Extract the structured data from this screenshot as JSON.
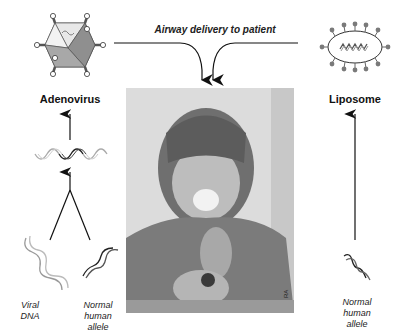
{
  "header": {
    "delivery_label": "Airway delivery to patient"
  },
  "left_column": {
    "vector_label": "Adenovirus",
    "vector_icon": "adenovirus-icon",
    "recombinant_icon": "recombinant-dna-icon",
    "inputs": [
      {
        "label_lines": [
          "Viral",
          "DNA"
        ],
        "icon": "viral-dna-icon"
      },
      {
        "label_lines": [
          "Normal",
          "human",
          "allele"
        ],
        "icon": "human-allele-icon"
      }
    ]
  },
  "right_column": {
    "vector_label": "Liposome",
    "vector_icon": "liposome-icon",
    "input": {
      "label_lines": [
        "Normal",
        "human",
        "allele"
      ],
      "icon": "human-allele-icon"
    }
  },
  "photo": {
    "subject": "child using inhaler with face mask",
    "credit": "RA"
  },
  "colors": {
    "stroke": "#111111",
    "viral_dna": "#8a8a8a",
    "human_dna": "#1a1a1a",
    "liposome_beads": "#7a7a7a"
  }
}
